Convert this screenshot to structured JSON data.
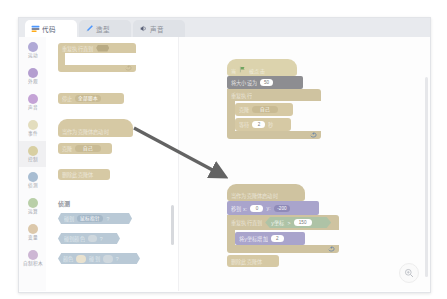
{
  "watermark": "",
  "tabs": [
    {
      "id": "code",
      "label": "代码",
      "icon": "code-icon",
      "active": true
    },
    {
      "id": "costumes",
      "label": "造型",
      "icon": "brush-icon",
      "active": false
    },
    {
      "id": "sounds",
      "label": "声音",
      "icon": "speaker-icon",
      "active": false
    }
  ],
  "categories": [
    {
      "label": "运动",
      "color": "#b0a9d6",
      "selected": false
    },
    {
      "label": "外观",
      "color": "#b49ed0",
      "selected": false
    },
    {
      "label": "声音",
      "color": "#c4a3d6",
      "selected": false
    },
    {
      "label": "事件",
      "color": "#d8cfa2",
      "selected": false
    },
    {
      "label": "控制",
      "color": "#d6c9a4",
      "selected": true
    },
    {
      "label": "侦测",
      "color": "#a8bdd2",
      "selected": false
    },
    {
      "label": "运算",
      "color": "#b3cfa0",
      "selected": false
    },
    {
      "label": "变量",
      "color": "#dcbb96",
      "selected": false
    },
    {
      "label": "自制积木",
      "color": "#c5a8cf",
      "selected": false
    }
  ],
  "palette": {
    "sections": [
      {
        "name": "控制",
        "heading": ""
      },
      {
        "name": "侦测",
        "heading": "侦测"
      }
    ],
    "blocks": {
      "repeat_until": {
        "label": "重复执行直到",
        "condition": ""
      },
      "stop": {
        "label": "停止",
        "option": "全部脚本"
      },
      "when_clone_start": {
        "label": "当作为克隆体启动时"
      },
      "create_clone": {
        "label": "克隆",
        "option": "自己"
      },
      "delete_clone": {
        "label": "删除此克隆体"
      },
      "touching": {
        "label": "碰到",
        "option": "鼠标指针",
        "suffix": "?"
      },
      "touching_color": {
        "label": "碰到颜色",
        "suffix": "?"
      },
      "color_touching": {
        "prefix": "颜色",
        "label": "碰到",
        "suffix": "?"
      }
    }
  },
  "canvas": {
    "script_one": {
      "hat": "当   被点击",
      "hat_icon": "green-flag-icon",
      "set_size": {
        "label": "将大小设为",
        "value": "50"
      },
      "forever": {
        "label": "重复执行"
      },
      "create_clone": {
        "label": "克隆",
        "option": "自己"
      },
      "wait": {
        "prefix": "等待",
        "value": "2",
        "suffix": "秒"
      }
    },
    "script_two": {
      "hat": "当作为克隆体启动时",
      "go_to": {
        "label": "移到 x:",
        "x": "0",
        "y_label": "y:",
        "y": "-200"
      },
      "repeat_until": {
        "label": "重复执行直到"
      },
      "condition": {
        "left": "y坐标",
        "op": ">",
        "right": "150"
      },
      "change_y": {
        "label": "将y坐标增加",
        "value": "2"
      },
      "delete_clone": {
        "label": "删除此克隆体"
      }
    }
  },
  "zoom_control": {
    "icon": "magnifier-icon"
  }
}
